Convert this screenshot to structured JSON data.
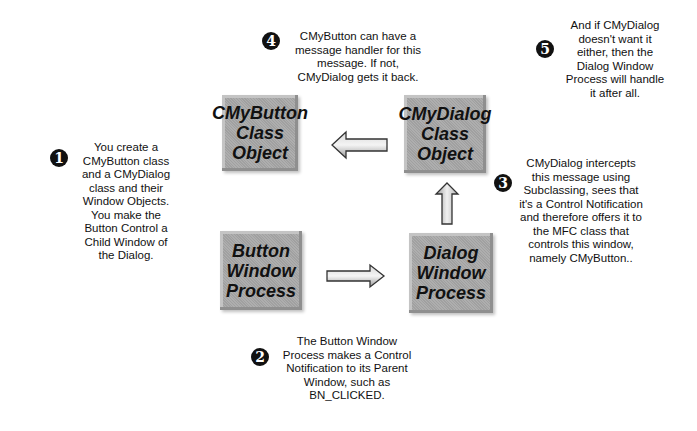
{
  "diagram": {
    "boxes": {
      "cmybutton": "CMyButton\nClass\nObject",
      "cmydialog": "CMyDialog\nClass\nObject",
      "button_wp": "Button\nWindow\nProcess",
      "dialog_wp": "Dialog\nWindow\nProcess"
    },
    "steps": [
      {
        "number": "1",
        "text": "You create a\nCMyButton class\nand a CMyDialog\nclass and their\nWindow Objects.\nYou make the\nButton Control a\nChild Window of\nthe Dialog."
      },
      {
        "number": "2",
        "text": "The Button Window\nProcess makes a Control\nNotification to its Parent\nWindow, such as\nBN_CLICKED."
      },
      {
        "number": "3",
        "text": "CMyDialog intercepts\nthis message using\nSubclassing, sees that\nit's a Control Notification\nand therefore offers it to\nthe MFC class that\ncontrols this window,\nnamely CMyButton.."
      },
      {
        "number": "4",
        "text": "CMyButton can have a\nmessage handler for this\nmessage. If not,\nCMyDialog gets it back."
      },
      {
        "number": "5",
        "text": "And if CMyDialog\ndoesn't want it\neither, then the\nDialog Window\nProcess will handle\nit after all."
      }
    ],
    "arrows": [
      {
        "from": "CMyDialog Class Object",
        "to": "CMyButton Class Object",
        "direction": "left"
      },
      {
        "from": "Button Window Process",
        "to": "Dialog Window Process",
        "direction": "right"
      },
      {
        "from": "Dialog Window Process",
        "to": "CMyDialog Class Object",
        "direction": "up"
      }
    ]
  }
}
